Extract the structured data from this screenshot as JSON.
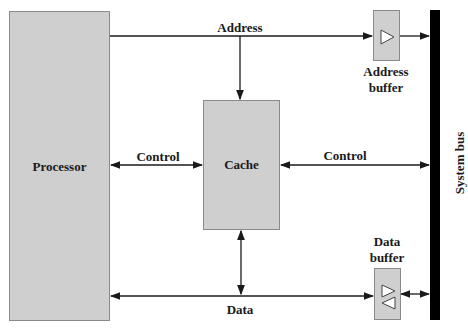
{
  "diagram": {
    "processor": {
      "label": "Processor"
    },
    "cache": {
      "label": "Cache"
    },
    "address_buffer": {
      "label_line1": "Address",
      "label_line2": "buffer"
    },
    "data_buffer": {
      "label_line1": "Data",
      "label_line2": "buffer"
    },
    "system_bus": {
      "label": "System bus"
    },
    "connections": {
      "address": "Address",
      "control_left": "Control",
      "control_right": "Control",
      "data": "Data"
    }
  },
  "colors": {
    "box_fill": "#cfcfcf",
    "line": "#1a1a1a",
    "bus": "#000000"
  }
}
